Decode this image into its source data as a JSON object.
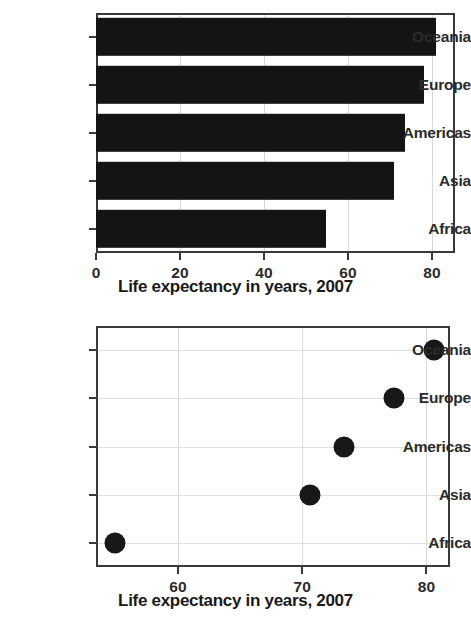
{
  "figure": {
    "panels": [
      {
        "id": "bar-panel",
        "axis_title": "Life expectancy in years, 2007"
      },
      {
        "id": "dot-panel",
        "axis_title": "Life expectancy in years, 2007"
      }
    ]
  },
  "chart_data": [
    {
      "type": "bar",
      "title": "",
      "orientation": "horizontal",
      "categories": [
        "Africa",
        "Asia",
        "Americas",
        "Europe",
        "Oceania"
      ],
      "values": [
        54.8,
        71.0,
        73.5,
        78.0,
        81.0
      ],
      "xlabel": "Life expectancy in years, 2007",
      "ylabel": "",
      "xlim": [
        0,
        85.5
      ],
      "xticks": [
        0,
        20,
        40,
        60,
        80
      ],
      "xticklabels": [
        "0",
        "20",
        "40",
        "60",
        "80"
      ],
      "yticklabels_top_to_bottom": [
        "Oceania",
        "Europe",
        "Americas",
        "Asia",
        "Africa"
      ],
      "grid": "vertical",
      "legend": "none",
      "bar_color": "#141414"
    },
    {
      "type": "scatter",
      "title": "",
      "orientation": "horizontal",
      "categories": [
        "Africa",
        "Asia",
        "Americas",
        "Europe",
        "Oceania"
      ],
      "values": [
        54.9,
        70.6,
        73.4,
        77.4,
        80.6
      ],
      "xlabel": "Life expectancy in years, 2007",
      "ylabel": "",
      "xlim": [
        53.4,
        81.9
      ],
      "xticks": [
        60,
        70,
        80
      ],
      "xticklabels": [
        "60",
        "70",
        "80"
      ],
      "yticklabels_top_to_bottom": [
        "Oceania",
        "Europe",
        "Americas",
        "Asia",
        "Africa"
      ],
      "grid": "both",
      "legend": "none",
      "marker_color": "#181818",
      "marker": "circle"
    }
  ]
}
